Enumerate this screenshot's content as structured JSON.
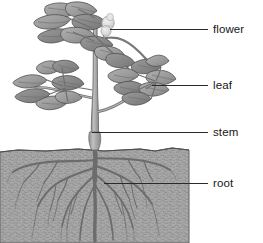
{
  "diagram": {
    "style": "grayscale line drawing",
    "canvas": {
      "width": 263,
      "height": 243,
      "background": "#ffffff"
    },
    "colors": {
      "soil_fill": "#a9a9a9",
      "soil_speckle": "#7e7e7e",
      "soil_outline": "#5a5a5a",
      "foliage_fill": "#9c9c9c",
      "foliage_shadow": "#777777",
      "foliage_outline": "#4d4d4d",
      "stem_fill": "#b4b4b4",
      "stem_outline": "#6b6b6b",
      "root_stroke": "#6e6e6e",
      "flower_fill": "#dcdcdc",
      "leader_line": "#2a2a2a",
      "label_text": "#161616"
    },
    "labels": [
      {
        "id": "flower",
        "text": "flower",
        "leader_from_x": 110,
        "leader_from_y": 29,
        "leader_to_x": 208,
        "leader_to_y": 29
      },
      {
        "id": "leaf",
        "text": "leaf",
        "leader_from_x": 152,
        "leader_from_y": 85,
        "leader_to_x": 208,
        "leader_to_y": 85
      },
      {
        "id": "stem",
        "text": "stem",
        "leader_from_x": 92,
        "leader_from_y": 132,
        "leader_to_x": 208,
        "leader_to_y": 132
      },
      {
        "id": "root",
        "text": "root",
        "leader_from_x": 104,
        "leader_from_y": 183,
        "leader_to_x": 208,
        "leader_to_y": 183
      }
    ],
    "parts": {
      "soil_block": {
        "left": 0,
        "top": 147,
        "right": 189,
        "bottom": 243
      },
      "stem": {
        "x": 94,
        "top": 20,
        "bottom": 150
      },
      "flower": {
        "cx": 108,
        "cy": 25,
        "r": 7
      },
      "leaf_clusters": [
        {
          "id": "top-cluster",
          "cx": 88,
          "cy": 30
        },
        {
          "id": "left-cluster",
          "cx": 45,
          "cy": 88
        },
        {
          "id": "right-cluster",
          "cx": 145,
          "cy": 85
        }
      ],
      "root_system": {
        "origin_x": 95,
        "origin_y": 150,
        "spread_left": 14,
        "spread_right": 162,
        "depth": 240
      }
    }
  }
}
